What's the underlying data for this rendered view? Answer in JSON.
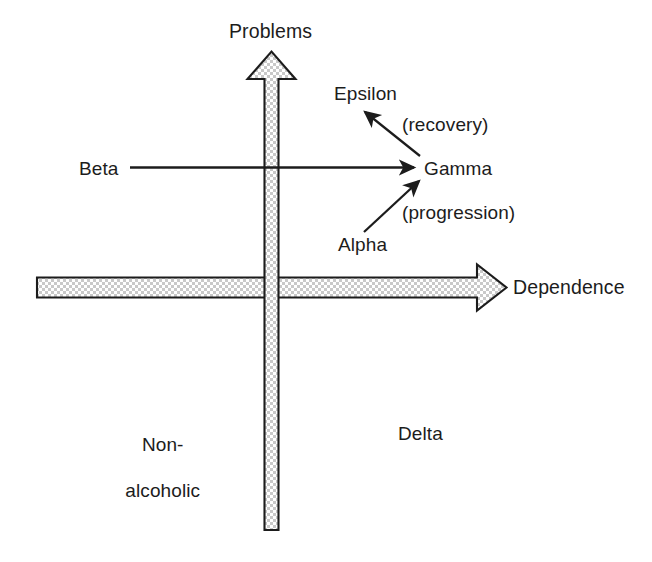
{
  "diagram": {
    "type": "quadrant-diagram",
    "background_color": "#ffffff",
    "ink_color": "#1c1c1c",
    "fill_pattern": "stipple-checkerboard-gray",
    "fill_color": "#d8d8d8",
    "axes": {
      "vertical": {
        "label": "Problems",
        "direction": "up",
        "style": "block-arrow-stippled"
      },
      "horizontal": {
        "label": "Dependence",
        "direction": "right",
        "style": "block-arrow-stippled"
      }
    },
    "nodes": [
      {
        "id": "epsilon",
        "label": "Epsilon"
      },
      {
        "id": "gamma",
        "label": "Gamma"
      },
      {
        "id": "beta",
        "label": "Beta"
      },
      {
        "id": "alpha",
        "label": "Alpha"
      },
      {
        "id": "delta",
        "label": "Delta"
      },
      {
        "id": "nonalcoholic_line1",
        "label": "Non-"
      },
      {
        "id": "nonalcoholic_line2",
        "label": "alcoholic"
      }
    ],
    "connector_labels": [
      {
        "id": "recovery",
        "label": "(recovery)"
      },
      {
        "id": "progression",
        "label": "(progression)"
      }
    ],
    "connectors": [
      {
        "id": "gamma-to-epsilon",
        "from": "Gamma",
        "to": "Epsilon",
        "annotation": "(recovery)",
        "style": "thin-arrow"
      },
      {
        "id": "beta-to-gamma",
        "from": "Beta",
        "to": "Gamma",
        "annotation": "",
        "style": "thin-arrow"
      },
      {
        "id": "alpha-to-gamma",
        "from": "Alpha",
        "to": "Gamma",
        "annotation": "(progression)",
        "style": "thin-arrow"
      }
    ]
  }
}
